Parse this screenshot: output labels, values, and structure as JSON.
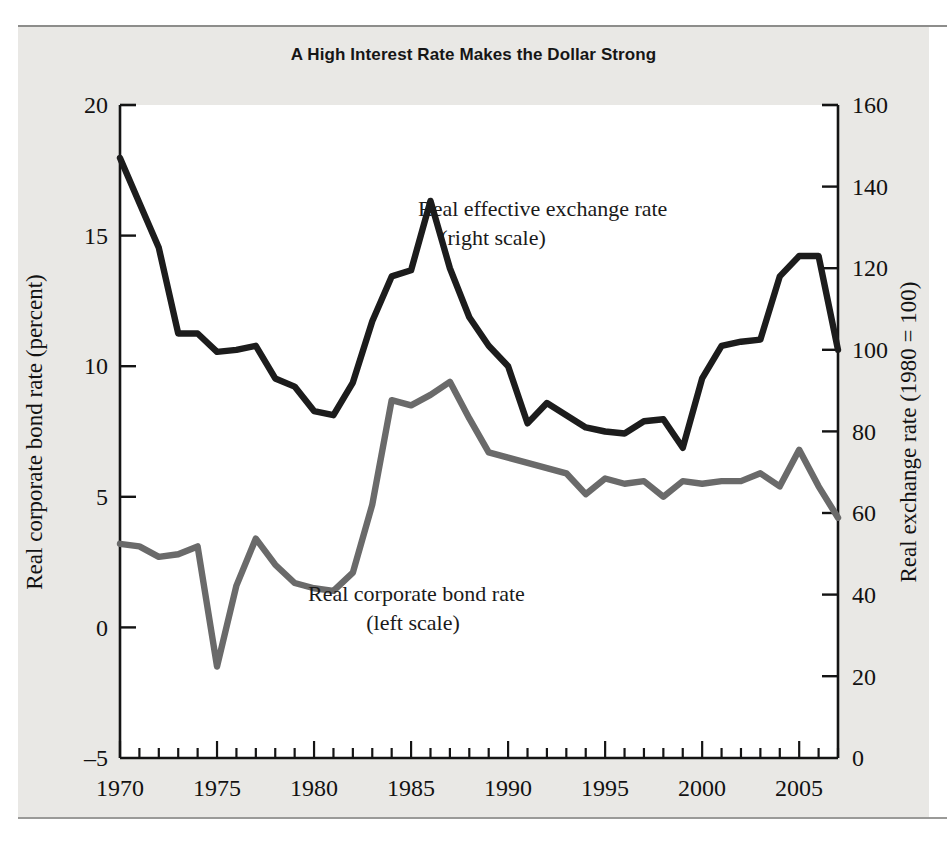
{
  "figure": {
    "title": "A High Interest Rate Makes the Dollar Strong"
  },
  "colors": {
    "paper": "#e9e8e5",
    "plot_background": "#ffffff",
    "axis": "#141414",
    "exchange_rate_line": "#1c1c1c",
    "bond_rate_line": "#6a6a6a",
    "rule": "#8d8d8b"
  },
  "axes": {
    "left": {
      "title": "Real corporate bond rate (percent)",
      "ticks": [
        "20",
        "15",
        "10",
        "5",
        "0",
        "–5"
      ],
      "min": -5,
      "max": 20
    },
    "right": {
      "title": "Real exchange rate (1980 = 100)",
      "ticks": [
        "160",
        "140",
        "120",
        "100",
        "80",
        "60",
        "40",
        "20",
        "0"
      ],
      "min": 0,
      "max": 160
    },
    "bottom": {
      "title": "",
      "ticks": [
        "1970",
        "1975",
        "1980",
        "1985",
        "1990",
        "1995",
        "2000",
        "2005"
      ],
      "min": 1970,
      "max": 2007
    }
  },
  "annotations": {
    "exchange_rate": {
      "line1": "Real effective exchange rate",
      "line2": "(right scale)"
    },
    "bond_rate": {
      "line1": "Real corporate bond rate",
      "line2": "(left scale)"
    }
  },
  "chart_data": {
    "type": "line",
    "title": "A High Interest Rate Makes the Dollar Strong",
    "xlabel": "",
    "ylabel": "Real corporate bond rate (percent)",
    "y2label": "Real exchange rate (1980 = 100)",
    "xlim": [
      1970,
      2007
    ],
    "ylim": [
      -5,
      20
    ],
    "y2lim": [
      0,
      160
    ],
    "grid": false,
    "legend": "inline-annotations",
    "x": [
      1970,
      1971,
      1972,
      1973,
      1974,
      1975,
      1976,
      1977,
      1978,
      1979,
      1980,
      1981,
      1982,
      1983,
      1984,
      1985,
      1986,
      1987,
      1988,
      1989,
      1990,
      1991,
      1992,
      1993,
      1994,
      1995,
      1996,
      1997,
      1998,
      1999,
      2000,
      2001,
      2002,
      2003,
      2004,
      2005,
      2006,
      2007
    ],
    "series": [
      {
        "name": "Real effective exchange rate (right scale)",
        "axis": "right",
        "units": "1980 = 100",
        "color": "#1c1c1c",
        "values": [
          147,
          136,
          125,
          104,
          104,
          99.5,
          100,
          101,
          93,
          91,
          85,
          84,
          92,
          107,
          118,
          119.5,
          136.5,
          120,
          108,
          101,
          96,
          82,
          87,
          84,
          81,
          80,
          79.5,
          82.5,
          83,
          76,
          93,
          101,
          102,
          102.5,
          118,
          123,
          123,
          100
        ]
      },
      {
        "name": "Real corporate bond rate (left scale)",
        "axis": "left",
        "units": "percent",
        "color": "#6a6a6a",
        "values": [
          3.2,
          3.1,
          2.7,
          2.8,
          3.1,
          -1.5,
          1.6,
          3.4,
          2.4,
          1.7,
          1.5,
          1.4,
          2.1,
          4.7,
          8.7,
          8.5,
          8.9,
          9.4,
          8.0,
          6.7,
          6.5,
          6.3,
          6.1,
          5.9,
          5.1,
          5.7,
          5.5,
          5.6,
          5.0,
          5.6,
          5.5,
          5.6,
          5.6,
          5.9,
          5.4,
          6.8,
          5.4,
          4.2
        ]
      }
    ],
    "notes": [
      "Exchange rate series peaks near 137 in 1985 and near 123 in 2001-2002, flattening near 100 after 2004.",
      "Bond rate series troughs near -1.5 percent in 1974 and peaks near 9.4 percent in 1984."
    ]
  }
}
